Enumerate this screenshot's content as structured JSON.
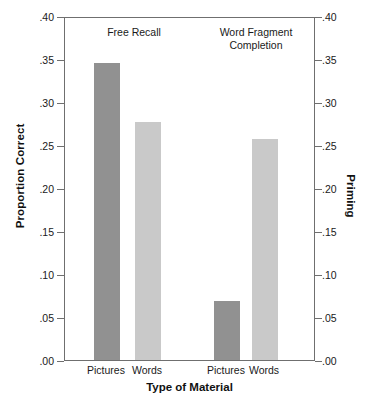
{
  "chart_data": {
    "type": "bar",
    "title": "",
    "xlabel": "Type of Material",
    "ylabel": "Proportion Correct",
    "ylabel_right": "Priming",
    "ylim": [
      0.0,
      0.4
    ],
    "ytick_values": [
      0.4,
      0.35,
      0.3,
      0.25,
      0.2,
      0.15,
      0.1,
      0.05,
      0.0
    ],
    "ytick_labels_left": [
      ".40",
      ".35",
      ".30",
      ".25",
      ".20",
      ".15",
      ".10",
      ".05",
      ".00"
    ],
    "ytick_labels_right": [
      ".40",
      ".35",
      ".30",
      ".25",
      ".20",
      ".15",
      ".10",
      ".05",
      ".00"
    ],
    "grid": false,
    "legend": "none",
    "groups": [
      {
        "name": "Free Recall",
        "categories": [
          "Pictures",
          "Words"
        ],
        "values": [
          0.347,
          0.279
        ]
      },
      {
        "name": "Word Fragment\nCompletion",
        "categories": [
          "Pictures",
          "Words"
        ],
        "values": [
          0.069,
          0.259
        ]
      }
    ],
    "bars": [
      {
        "group": "Free Recall",
        "category": "Pictures",
        "value": 0.347,
        "color": "#919191"
      },
      {
        "group": "Free Recall",
        "category": "Words",
        "value": 0.279,
        "color": "#c9c9c9"
      },
      {
        "group": "Word Fragment Completion",
        "category": "Pictures",
        "value": 0.069,
        "color": "#919191"
      },
      {
        "group": "Word Fragment Completion",
        "category": "Words",
        "value": 0.259,
        "color": "#c9c9c9"
      }
    ],
    "colors": {
      "pictures_bar": "#919191",
      "words_bar": "#c9c9c9",
      "axis": "#6f6f6f",
      "text": "#1a1a1a",
      "background": "#ffffff"
    }
  }
}
